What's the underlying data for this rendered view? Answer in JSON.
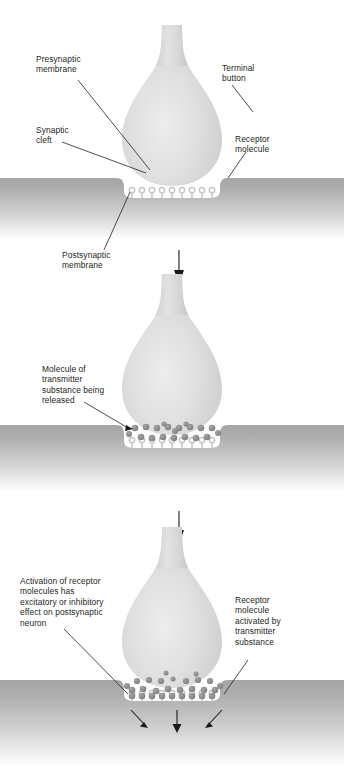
{
  "figure": {
    "type": "three-stage biological process diagram"
  },
  "colors": {
    "membrane_dark": "#a9a9a9",
    "membrane_light": "#ffffff",
    "terminal_button_light": "#e3e3e3",
    "terminal_button_mid": "#cfcfcf",
    "terminal_button_edge": "#bdbdbd",
    "molecule": "#8d8d8d",
    "receptor_stroke": "#c9c9c9",
    "text": "#231f20",
    "arrow": "#1a1a1a",
    "background": "#ffffff"
  },
  "panels": [
    {
      "id": "panel-resting",
      "stage_number": 1,
      "stage_name": "Resting synapse",
      "labels": [
        {
          "name": "presynaptic-membrane",
          "text": "Presynaptic\nmembrane",
          "side": "left"
        },
        {
          "name": "synaptic-cleft",
          "text": "Synaptic\ncleft",
          "side": "left"
        },
        {
          "name": "terminal-button",
          "text": "Terminal\nbutton",
          "side": "right"
        },
        {
          "name": "receptor-molecule",
          "text": "Receptor\nmolecule",
          "side": "right"
        },
        {
          "name": "postsynaptic-membrane",
          "text": "Postsynaptic\nmembrane",
          "side": "left"
        }
      ],
      "molecule_count": 0,
      "receptor_count": 9
    },
    {
      "id": "panel-release",
      "stage_number": 2,
      "stage_name": "Transmitter release",
      "labels": [
        {
          "name": "molecule-of-transmitter-substance-being-released",
          "text": "Molecule of\ntransmitter\nsubstance being\nreleased",
          "side": "left"
        }
      ],
      "molecule_count": 20,
      "receptor_count": 9
    },
    {
      "id": "panel-activation",
      "stage_number": 3,
      "stage_name": "Receptor activation",
      "labels": [
        {
          "name": "activation-of-receptor-molecules",
          "text": "Activation of receptor\nmolecules has\nexcitatory or inhibitory\neffect on postsynaptic\nneuron",
          "side": "left"
        },
        {
          "name": "receptor-molecule-activated-by-transmitter-substance",
          "text": "Receptor\nmolecule\nactivated by\ntransmitter\nsubstance",
          "side": "right"
        }
      ],
      "molecule_count": 28,
      "receptor_count": 9,
      "effect_arrows": 3
    }
  ],
  "transition_arrows": [
    {
      "name": "transition-arrow-1",
      "direction": "down",
      "between": "panel-resting to panel-release"
    },
    {
      "name": "transition-arrow-2",
      "direction": "down",
      "between": "panel-release to panel-activation"
    }
  ]
}
